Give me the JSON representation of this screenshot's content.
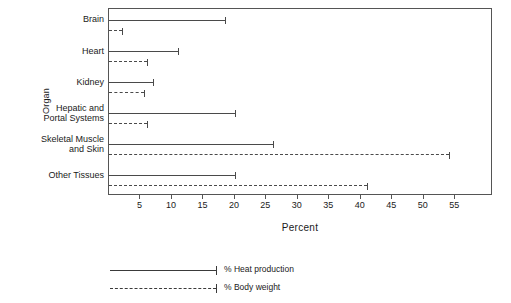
{
  "chart_data": {
    "type": "bar",
    "orientation": "horizontal",
    "title": "",
    "xlabel": "Percent",
    "ylabel": "Organ",
    "xlim": [
      0,
      61
    ],
    "xticks": [
      5,
      10,
      15,
      20,
      25,
      30,
      35,
      40,
      45,
      50,
      55
    ],
    "grid": false,
    "legend_position": "below",
    "categories": [
      "Brain",
      "Heart",
      "Kidney",
      "Hepatic and\nPortal Systems",
      "Skeletal Muscle\nand Skin",
      "Other Tissues"
    ],
    "category_lines": [
      [
        "Brain"
      ],
      [
        "Heart"
      ],
      [
        "Kidney"
      ],
      [
        "Hepatic and",
        "Portal Systems"
      ],
      [
        "Skeletal Muscle",
        "and Skin"
      ],
      [
        "Other Tissues"
      ]
    ],
    "series": [
      {
        "name": "% Heat production",
        "style": "solid",
        "values": [
          18.5,
          11,
          7,
          20,
          26,
          20
        ]
      },
      {
        "name": "% Body weight",
        "style": "dashed",
        "values": [
          2,
          6,
          5.5,
          6,
          54,
          41
        ]
      }
    ]
  },
  "legend": {
    "items": [
      {
        "label": "% Heat production",
        "style": "solid"
      },
      {
        "label": "% Body weight",
        "style": "dashed"
      }
    ]
  },
  "axis": {
    "x_title": "Percent",
    "y_title": "Organ",
    "x_tick_labels": [
      "5",
      "10",
      "15",
      "20",
      "25",
      "30",
      "35",
      "40",
      "45",
      "50",
      "55"
    ]
  },
  "colors": {
    "line": "#4a4a4a",
    "frame": "#555555",
    "text": "#1a1a1a",
    "background": "#ffffff"
  }
}
